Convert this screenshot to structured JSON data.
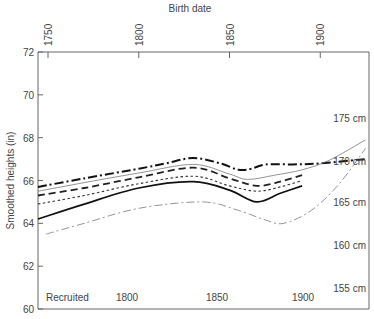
{
  "chart_data": {
    "type": "line",
    "title": "",
    "top_xlabel": "Birth date",
    "top_xticks": [
      "1750",
      "1800",
      "1850",
      "1900"
    ],
    "bottom_xlabel": "Recruited",
    "bottom_xticks": [
      "1800",
      "1850",
      "1900"
    ],
    "ylabel": "Smoothed heights (in)",
    "yticks": [
      "60",
      "62",
      "64",
      "66",
      "68",
      "70",
      "72"
    ],
    "ylim": [
      60,
      72
    ],
    "xlim": [
      1744,
      1927
    ],
    "right_axis_labels": [
      {
        "label": "175 cm",
        "value": 68.9
      },
      {
        "label": "170 cm",
        "value": 66.9
      },
      {
        "label": "165 cm",
        "value": 65.0
      },
      {
        "label": "160 cm",
        "value": 63.0
      },
      {
        "label": "155 cm",
        "value": 61.0
      }
    ],
    "grid": false,
    "legend": "none",
    "series": [
      {
        "name": "series-1-thick-dashdot",
        "style": "thick-dashdot",
        "color": "#111111",
        "x": [
          1744,
          1770,
          1800,
          1815,
          1830,
          1845,
          1855,
          1862,
          1870,
          1885,
          1900,
          1925
        ],
        "y": [
          65.7,
          66.1,
          66.55,
          66.8,
          67.05,
          66.8,
          66.5,
          66.55,
          66.75,
          66.75,
          66.8,
          67.0
        ]
      },
      {
        "name": "series-2-thin-solid",
        "style": "thin-solid",
        "color": "#777777",
        "x": [
          1744,
          1770,
          1800,
          1830,
          1850,
          1860,
          1875,
          1890,
          1905,
          1925
        ],
        "y": [
          65.5,
          65.9,
          66.35,
          66.75,
          66.3,
          66.05,
          66.25,
          66.5,
          66.95,
          67.9
        ]
      },
      {
        "name": "series-3-thick-dashed",
        "style": "thick-dashed",
        "color": "#222222",
        "x": [
          1744,
          1770,
          1800,
          1830,
          1850,
          1865,
          1878,
          1890
        ],
        "y": [
          65.3,
          65.65,
          66.15,
          66.6,
          66.1,
          65.75,
          65.95,
          66.25
        ]
      },
      {
        "name": "series-4-dotted",
        "style": "dotted",
        "color": "#333333",
        "x": [
          1744,
          1770,
          1800,
          1830,
          1850,
          1865,
          1878,
          1890
        ],
        "y": [
          64.9,
          65.3,
          65.85,
          66.2,
          65.75,
          65.5,
          65.7,
          66.0
        ]
      },
      {
        "name": "series-5-thick-solid",
        "style": "thick-solid",
        "color": "#111111",
        "x": [
          1744,
          1770,
          1800,
          1830,
          1850,
          1865,
          1878,
          1890
        ],
        "y": [
          64.2,
          64.9,
          65.65,
          65.95,
          65.55,
          65.0,
          65.4,
          65.75
        ]
      },
      {
        "name": "series-6-grey-dashdot",
        "style": "thin-dashdot",
        "color": "#888888",
        "x": [
          1749,
          1770,
          1800,
          1835,
          1855,
          1870,
          1880,
          1895,
          1910,
          1925
        ],
        "y": [
          63.5,
          64.0,
          64.7,
          65.0,
          64.6,
          64.15,
          64.0,
          64.6,
          65.8,
          67.5
        ]
      }
    ]
  }
}
